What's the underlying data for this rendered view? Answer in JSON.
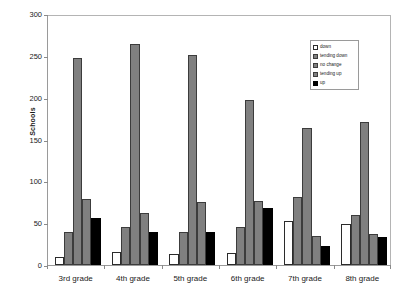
{
  "chart_data": {
    "type": "bar",
    "title": "",
    "xlabel": "",
    "ylabel": "Schools",
    "ylim": [
      0,
      300
    ],
    "yticks": [
      0,
      50,
      100,
      150,
      200,
      250,
      300
    ],
    "grid": false,
    "legend_position": "top-right",
    "categories": [
      "3rd grade",
      "4th grade",
      "5th grade",
      "6th grade",
      "7th grade",
      "8th grade"
    ],
    "series": [
      {
        "name": "down",
        "color": "#ffffff",
        "values": [
          9,
          15,
          13,
          14,
          53,
          49
        ]
      },
      {
        "name": "tending down",
        "color": "#808080",
        "values": [
          39,
          45,
          40,
          45,
          81,
          60
        ]
      },
      {
        "name": "no change",
        "color": "#808080",
        "values": [
          248,
          264,
          251,
          197,
          164,
          171
        ]
      },
      {
        "name": "tending up",
        "color": "#808080",
        "values": [
          79,
          62,
          75,
          76,
          35,
          37
        ]
      },
      {
        "name": "up",
        "color": "#000000",
        "values": [
          56,
          39,
          39,
          68,
          23,
          34
        ]
      }
    ]
  },
  "axes": {
    "y_title": "Schools",
    "y_tick_labels": [
      "300",
      "250",
      "200",
      "150",
      "100",
      "50",
      "0"
    ],
    "x_tick_labels": [
      "3rd grade",
      "4th grade",
      "5th grade",
      "6th grade",
      "7th grade",
      "8th grade"
    ]
  },
  "legend": {
    "entries": [
      {
        "label": "down"
      },
      {
        "label": "tending down"
      },
      {
        "label": "no change"
      },
      {
        "label": "tending up"
      },
      {
        "label": "up"
      }
    ]
  },
  "colors": {
    "series_white": "#ffffff",
    "series_gray": "#808080",
    "series_black": "#000000",
    "axis_line": "#9a9a9a",
    "text": "#1a1a1a",
    "plot_background": "#ffffff"
  }
}
